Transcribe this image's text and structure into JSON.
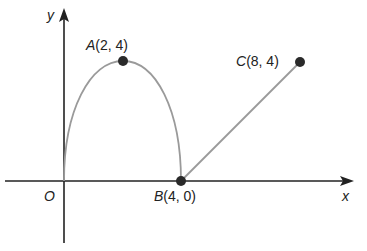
{
  "axes": {
    "x_label": "x",
    "y_label": "y",
    "origin_label": "O"
  },
  "points": [
    {
      "name": "A",
      "label": "(2, 4)",
      "x": 2,
      "y": 4
    },
    {
      "name": "B",
      "label": "(4, 0)",
      "x": 4,
      "y": 0
    },
    {
      "name": "C",
      "label": "(8, 4)",
      "x": 8,
      "y": 4
    }
  ],
  "curves": [
    {
      "type": "parabolic-arc",
      "from": "O",
      "through": "A",
      "to": "B"
    },
    {
      "type": "line-segment",
      "from": "B",
      "to": "C"
    }
  ],
  "colors": {
    "axis": "#222222",
    "curve": "#9a9a9a",
    "point": "#2a2a2a"
  }
}
